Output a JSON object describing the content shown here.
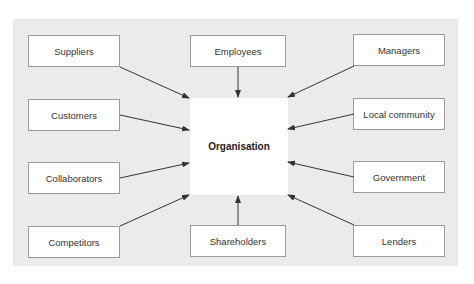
{
  "diagram": {
    "center": {
      "label": "Organisation"
    },
    "stakeholders": [
      {
        "id": "suppliers",
        "label": "Suppliers",
        "position": "top-left"
      },
      {
        "id": "employees",
        "label": "Employees",
        "position": "top-center"
      },
      {
        "id": "managers",
        "label": "Managers",
        "position": "top-right"
      },
      {
        "id": "customers",
        "label": "Customers",
        "position": "row2-left"
      },
      {
        "id": "local-community",
        "label": "Local community",
        "position": "row2-right"
      },
      {
        "id": "collaborators",
        "label": "Collaborators",
        "position": "row3-left"
      },
      {
        "id": "government",
        "label": "Government",
        "position": "row3-right"
      },
      {
        "id": "competitors",
        "label": "Competitors",
        "position": "bottom-left"
      },
      {
        "id": "shareholders",
        "label": "Shareholders",
        "position": "bottom-center"
      },
      {
        "id": "lenders",
        "label": "Lenders",
        "position": "bottom-right"
      }
    ],
    "colors": {
      "panel": "#ebebeb",
      "box_border": "#9a9a9a",
      "arrow": "#333333"
    }
  },
  "caption": {
    "text": ""
  }
}
